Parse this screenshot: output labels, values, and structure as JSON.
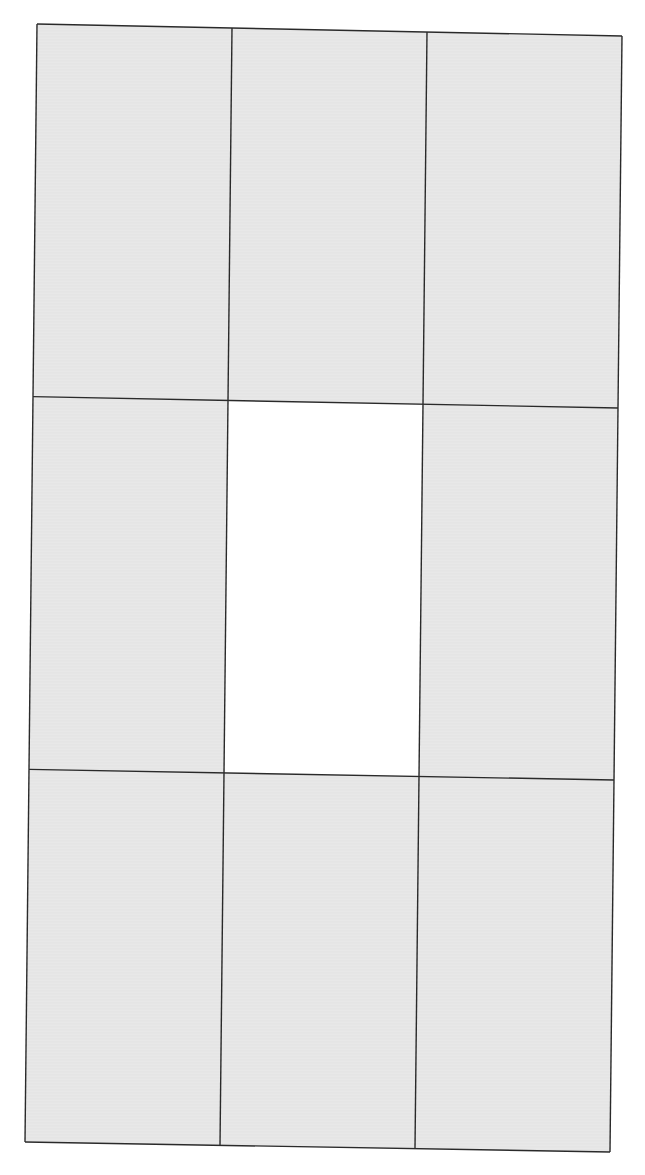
{
  "canvas": {
    "width": 645,
    "height": 1175,
    "background": "#ffffff"
  },
  "grid": {
    "rows": 3,
    "cols": 3,
    "line_color": "#2a2a2a",
    "corners": {
      "top_left": [
        37,
        24
      ],
      "top_right": [
        622,
        36
      ],
      "bottom_left": [
        25,
        1142
      ],
      "bottom_right": [
        610,
        1152
      ]
    },
    "cells": [
      {
        "row": 0,
        "col": 0,
        "fill": "#e8e8e8",
        "state": "filled"
      },
      {
        "row": 0,
        "col": 1,
        "fill": "#e8e8e8",
        "state": "filled"
      },
      {
        "row": 0,
        "col": 2,
        "fill": "#e8e8e8",
        "state": "filled"
      },
      {
        "row": 1,
        "col": 0,
        "fill": "#e8e8e8",
        "state": "filled"
      },
      {
        "row": 1,
        "col": 1,
        "fill": "#ffffff",
        "state": "empty"
      },
      {
        "row": 1,
        "col": 2,
        "fill": "#e8e8e8",
        "state": "filled"
      },
      {
        "row": 2,
        "col": 0,
        "fill": "#e8e8e8",
        "state": "filled"
      },
      {
        "row": 2,
        "col": 1,
        "fill": "#e8e8e8",
        "state": "filled"
      },
      {
        "row": 2,
        "col": 2,
        "fill": "#e8e8e8",
        "state": "filled"
      }
    ]
  }
}
